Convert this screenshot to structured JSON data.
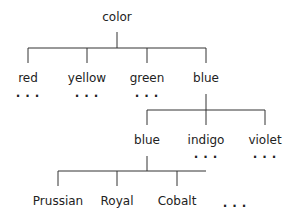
{
  "tree": {
    "root": {
      "label": "color"
    },
    "level1": [
      {
        "label": "red",
        "more": "..."
      },
      {
        "label": "yellow",
        "more": "..."
      },
      {
        "label": "green",
        "more": "..."
      },
      {
        "label": "blue"
      }
    ],
    "level2": [
      {
        "label": "blue"
      },
      {
        "label": "indigo",
        "more": "..."
      },
      {
        "label": "violet",
        "more": "..."
      }
    ],
    "level3": [
      {
        "label": "Prussian"
      },
      {
        "label": "Royal"
      },
      {
        "label": "Cobalt"
      }
    ],
    "level3_more": "..."
  },
  "colors": {
    "line": "#333333",
    "text": "#222222"
  }
}
